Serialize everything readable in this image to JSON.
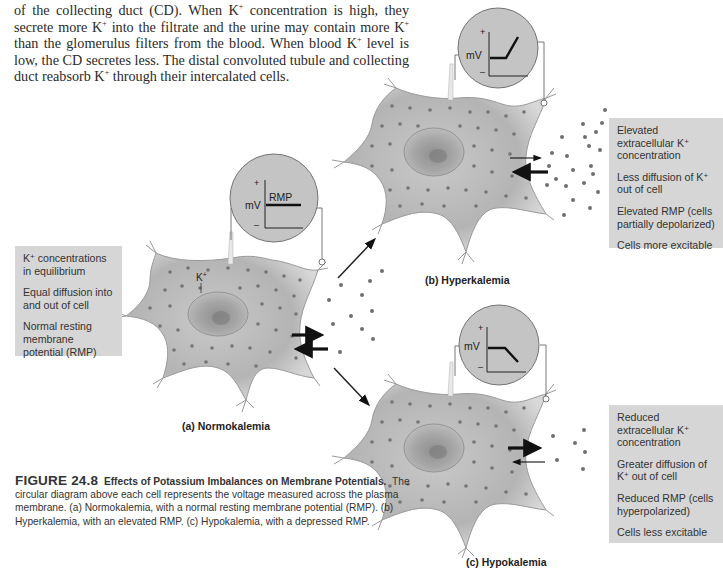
{
  "body_text": {
    "line1_a": "of the collecting duct (CD). When K",
    "line1_sup": "+",
    "line1_b": " concentration is high, they secrete more K",
    "line2_sup": "+",
    "line2_b": " into the filtrate and the urine may contain more K",
    "line3_sup": "+",
    "line3_b": " than the glomerulus filters from the blood. When blood K",
    "line4_sup": "+",
    "line4_b": " level is low, the CD secretes less. The distal convoluted tubule and collecting duct reabsorb K",
    "line5_sup": "+",
    "line5_b": " through their intercalated cells."
  },
  "panels": {
    "a": {
      "label": "(a) Normokalemia",
      "ion_label": "K",
      "ion_sup": "+",
      "meter": {
        "axis_plus": "+",
        "axis_minus": "–",
        "unit": "mV",
        "trace_label": "RMP",
        "trace": "flat"
      },
      "info": [
        {
          "pre": "K",
          "sup": "+",
          "post": " concentrations in equilibrium"
        },
        {
          "pre": "Equal diffusion into and out of cell",
          "sup": "",
          "post": ""
        },
        {
          "pre": "Normal resting membrane potential (RMP)",
          "sup": "",
          "post": ""
        }
      ]
    },
    "b": {
      "label": "(b) Hyperkalemia",
      "meter": {
        "axis_plus": "+",
        "axis_minus": "–",
        "unit": "mV",
        "trace": "rising"
      },
      "info": [
        {
          "pre": "Elevated extracellular K",
          "sup": "+",
          "post": " concentration"
        },
        {
          "pre": "Less diffusion of K",
          "sup": "+",
          "post": " out of cell"
        },
        {
          "pre": "Elevated RMP (cells partially depolarized)",
          "sup": "",
          "post": ""
        },
        {
          "pre": "Cells more excitable",
          "sup": "",
          "post": ""
        }
      ]
    },
    "c": {
      "label": "(c) Hypokalemia",
      "meter": {
        "axis_plus": "+",
        "axis_minus": "–",
        "unit": "mV",
        "trace": "falling"
      },
      "info": [
        {
          "pre": "Reduced extracellular K",
          "sup": "+",
          "post": " concentration"
        },
        {
          "pre": "Greater diffusion of K",
          "sup": "+",
          "post": " out of cell"
        },
        {
          "pre": "Reduced RMP (cells hyperpolarized)",
          "sup": "",
          "post": ""
        },
        {
          "pre": "Cells less excitable",
          "sup": "",
          "post": ""
        }
      ]
    }
  },
  "caption": {
    "fig_num": "FIGURE 24.8",
    "fig_title": "Effects of Potassium Imbalances on Membrane Potentials.",
    "fig_body": "The circular diagram above each cell represents the voltage measured across the plasma membrane. (a) Normokalemia, with a normal resting membrane potential (RMP). (b) Hyperkalemia, with an elevated RMP. (c) Hypokalemia, with a depressed RMP."
  },
  "colors": {
    "cell_fill": "#b9b9b9",
    "meter_fill": "#c4c4c4",
    "infobox_bg": "#d6d6d6",
    "text": "#2a2a2a"
  }
}
